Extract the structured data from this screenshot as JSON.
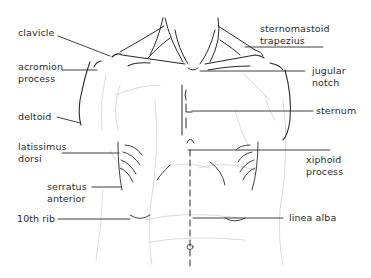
{
  "diagram": {
    "colors": {
      "ink": "#2a2a2a",
      "faint": "#c8c8c8",
      "background": "#ffffff"
    },
    "labels": {
      "clavicle": "clavicle",
      "acromion_process": "acromion\nprocess",
      "deltoid": "deltoid",
      "latissimus_dorsi": "latissimus\ndorsi",
      "serratus_anterior": "serratus\nanterior",
      "tenth_rib": "10th rib",
      "sternomastoid_trapezius": "sternomastoid\ntrapezius",
      "jugular_notch": "jugular\nnotch",
      "sternum": "sternum",
      "xiphoid_process": "xiphoid\nprocess",
      "linea_alba": "linea alba"
    }
  }
}
